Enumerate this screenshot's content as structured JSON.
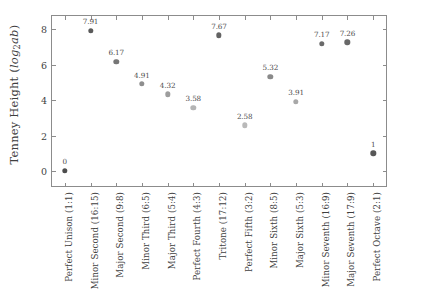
{
  "chart_data": {
    "type": "scatter",
    "title": "",
    "xlabel": "",
    "ylabel": "Tenney Height (log2ab)",
    "ylabel_parts": {
      "prefix": "Tenney Height (",
      "math_base": "log",
      "math_sub": "2",
      "math_args": "ab",
      "suffix": ")"
    },
    "ylim": [
      -0.85,
      8.75
    ],
    "yticks": [
      0,
      2,
      4,
      6,
      8
    ],
    "ytick_labels": [
      "0",
      "2",
      "4",
      "6",
      "8"
    ],
    "grid": false,
    "legend": false,
    "frame": "full-box",
    "categories": [
      "Perfect Unison (1:1)",
      "Minor Second (16:15)",
      "Major Second (9:8)",
      "Minor Third (6:5)",
      "Major Third (5:4)",
      "Perfect Fourth (4:3)",
      "Tritone (17:12)",
      "Perfect Fifth (3:2)",
      "Minor Sixth (8:5)",
      "Major Sixth (5:3)",
      "Minor Seventh (16:9)",
      "Major Seventh (17:9)",
      "Perfect Octave (2:1)"
    ],
    "values": [
      0,
      7.91,
      6.17,
      4.91,
      4.32,
      3.58,
      7.67,
      2.58,
      5.32,
      3.91,
      7.17,
      7.26,
      1
    ],
    "point_labels": [
      "0",
      "7.91",
      "6.17",
      "4.91",
      "4.32",
      "3.58",
      "7.67",
      "2.58",
      "5.32",
      "3.91",
      "7.17",
      "7.26",
      "1"
    ],
    "point_colors": [
      "#4d4d4d",
      "#5a5a5a",
      "#767676",
      "#8e8e8e",
      "#9d9d9d",
      "#b4b4b4",
      "#636363",
      "#b9b9b9",
      "#8a8a8a",
      "#a8a8a8",
      "#6a6a6a",
      "#686868",
      "#575757"
    ],
    "axis_color": "#8c8c8c",
    "text_color": "#3f3f3f",
    "background": "#ffffff"
  }
}
